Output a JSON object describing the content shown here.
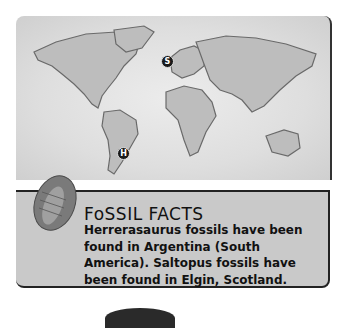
{
  "map": {
    "markers": [
      {
        "label": "S",
        "location": "Elgin, Scotland"
      },
      {
        "label": "H",
        "location": "Argentina"
      }
    ]
  },
  "facts": {
    "title": "FoSSIL FACTS",
    "body": "Herrerasaurus fossils have been found in Argentina (South America). Saltopus fossils have been found in Elgin, Scotland.",
    "icon": "trilobite-icon"
  }
}
